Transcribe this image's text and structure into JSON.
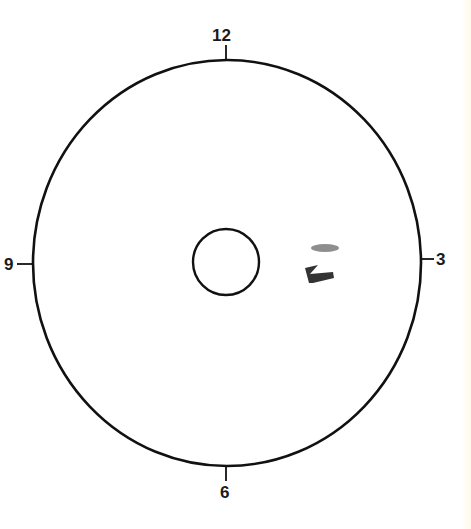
{
  "diagram": {
    "type": "clock-face",
    "labels": {
      "top": "12",
      "right": "3",
      "bottom": "6",
      "left": "9"
    },
    "outer_ring": {
      "cx": 227,
      "cy": 263,
      "rx": 194,
      "ry": 203
    },
    "inner_circle": {
      "cx": 226,
      "cy": 262,
      "r": 33
    },
    "marks": [
      {
        "name": "smudge-mark",
        "description": "grey horizontal smudge"
      },
      {
        "name": "arrow-mark",
        "description": "dark hand-drawn arrow-like shape"
      }
    ],
    "colors": {
      "line": "#111111",
      "mark": "#3a3a3a",
      "smudge": "#7a7a7a"
    }
  }
}
